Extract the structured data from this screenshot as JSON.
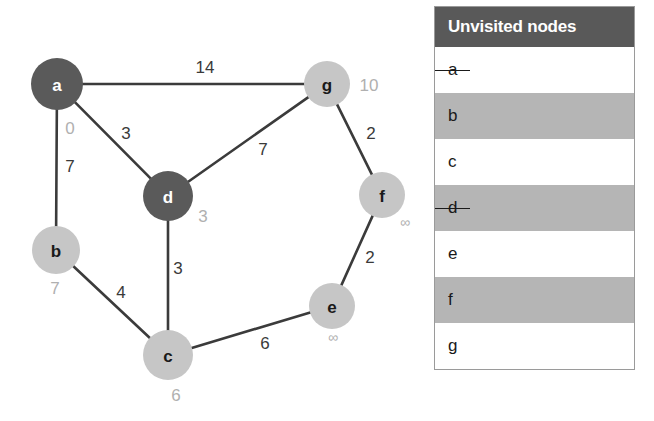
{
  "graph": {
    "nodes": [
      {
        "id": "a",
        "label": "a",
        "x": 57,
        "y": 84,
        "r": 26,
        "state": "visited",
        "distance": "0",
        "dist_x": 70,
        "dist_y": 128
      },
      {
        "id": "g",
        "label": "g",
        "x": 327,
        "y": 84,
        "r": 23,
        "state": "unvisited",
        "distance": "10",
        "dist_x": 369,
        "dist_y": 85
      },
      {
        "id": "d",
        "label": "d",
        "x": 168,
        "y": 196,
        "r": 25,
        "state": "visited",
        "distance": "3",
        "dist_x": 203,
        "dist_y": 216
      },
      {
        "id": "f",
        "label": "f",
        "x": 382,
        "y": 195,
        "r": 23,
        "state": "unvisited",
        "distance": "∞",
        "dist_x": 405,
        "dist_y": 222
      },
      {
        "id": "b",
        "label": "b",
        "x": 56,
        "y": 250,
        "r": 24,
        "state": "unvisited",
        "distance": "7",
        "dist_x": 55,
        "dist_y": 288
      },
      {
        "id": "e",
        "label": "e",
        "x": 332,
        "y": 306,
        "r": 23,
        "state": "unvisited",
        "distance": "∞",
        "dist_x": 333,
        "dist_y": 337
      },
      {
        "id": "c",
        "label": "c",
        "x": 168,
        "y": 355,
        "r": 25,
        "state": "unvisited",
        "distance": "6",
        "dist_x": 176,
        "dist_y": 395
      }
    ],
    "edges": [
      {
        "from": "a",
        "to": "g",
        "weight": "14",
        "label_x": 205,
        "label_y": 67
      },
      {
        "from": "a",
        "to": "d",
        "weight": "3",
        "label_x": 126,
        "label_y": 133
      },
      {
        "from": "a",
        "to": "b",
        "weight": "7",
        "label_x": 70,
        "label_y": 166
      },
      {
        "from": "d",
        "to": "g",
        "weight": "7",
        "label_x": 263,
        "label_y": 149
      },
      {
        "from": "g",
        "to": "f",
        "weight": "2",
        "label_x": 371,
        "label_y": 133
      },
      {
        "from": "d",
        "to": "c",
        "weight": "3",
        "label_x": 178,
        "label_y": 268
      },
      {
        "from": "b",
        "to": "c",
        "weight": "4",
        "label_x": 121,
        "label_y": 292
      },
      {
        "from": "f",
        "to": "e",
        "weight": "2",
        "label_x": 370,
        "label_y": 257
      },
      {
        "from": "c",
        "to": "e",
        "weight": "6",
        "label_x": 265,
        "label_y": 343
      }
    ],
    "colors": {
      "visited_fill": "#5a5a5a",
      "unvisited_fill": "#c6c6c6",
      "edge_stroke": "#3b3b3b",
      "distance_text": "#b0b0b0",
      "weight_text": "#3a3a3a"
    }
  },
  "table": {
    "header": "Unvisited nodes",
    "rows": [
      {
        "label": "a",
        "struck": true
      },
      {
        "label": "b",
        "struck": false
      },
      {
        "label": "c",
        "struck": false
      },
      {
        "label": "d",
        "struck": true
      },
      {
        "label": "e",
        "struck": false
      },
      {
        "label": "f",
        "struck": false
      },
      {
        "label": "g",
        "struck": false
      }
    ],
    "colors": {
      "header_bg": "#595959",
      "header_text": "#ffffff",
      "row_odd_bg": "#ffffff",
      "row_even_bg": "#b5b5b5",
      "border": "#9a9a9a"
    }
  }
}
